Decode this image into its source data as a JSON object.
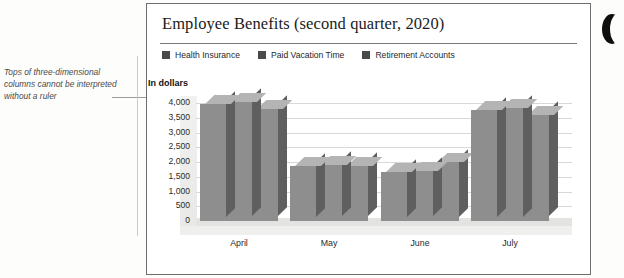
{
  "annotation": {
    "text": "Tops of three-dimensional columns cannot be interpreted without a ruler"
  },
  "chart_data": {
    "type": "bar",
    "title": "Employee Benefits (second quarter, 2020)",
    "xlabel": "",
    "ylabel": "In dollars",
    "categories": [
      "April",
      "May",
      "June",
      "July"
    ],
    "series": [
      {
        "name": "Health Insurance",
        "values": [
          3950,
          1850,
          1650,
          3750
        ]
      },
      {
        "name": "Paid Vacation Time",
        "values": [
          4050,
          1900,
          1700,
          3820
        ]
      },
      {
        "name": "Retirement Accounts",
        "values": [
          3800,
          1880,
          2000,
          3600
        ]
      }
    ],
    "ylim": [
      0,
      4000
    ],
    "yticks": [
      "4,000",
      "3,500",
      "3,000",
      "2,500",
      "2,000",
      "1,500",
      "1,000",
      "500",
      "0"
    ],
    "grid": true,
    "legend_position": "top",
    "colors": {
      "series_face": "#8e8e8e",
      "series_top": "#b4b4b4",
      "series_side": "#5f5f5f",
      "legend_swatch": "#4a4a4a",
      "gridline": "#d8d8d8",
      "frame": "#6e6e6e"
    }
  }
}
